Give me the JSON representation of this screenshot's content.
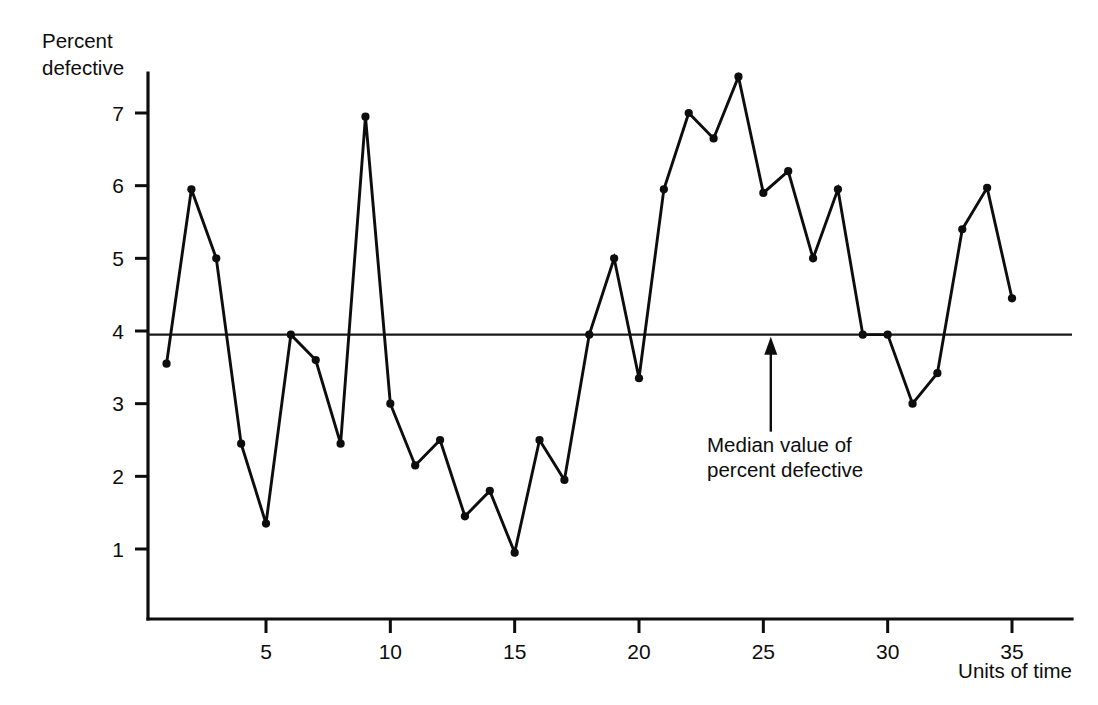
{
  "chart_data": {
    "type": "line",
    "title": "",
    "ylabel_line1": "Percent",
    "ylabel_line2": "defective",
    "xlabel": "Units of time",
    "x": [
      1,
      2,
      3,
      4,
      5,
      6,
      7,
      8,
      9,
      10,
      11,
      12,
      13,
      14,
      15,
      16,
      17,
      18,
      19,
      20,
      21,
      22,
      23,
      24,
      25,
      26,
      27,
      28,
      29,
      30,
      31,
      32,
      33,
      34,
      35
    ],
    "values": [
      3.55,
      5.95,
      5.0,
      2.45,
      1.35,
      3.95,
      3.6,
      2.45,
      6.95,
      3.0,
      2.15,
      2.5,
      1.45,
      1.8,
      0.95,
      2.5,
      1.95,
      3.95,
      5.0,
      3.35,
      5.95,
      7.0,
      6.65,
      7.5,
      5.9,
      6.2,
      5.0,
      5.95,
      3.95,
      3.95,
      3.0,
      3.42,
      5.4,
      5.97,
      4.45
    ],
    "xlim": [
      0.2,
      36.2
    ],
    "ylim": [
      0,
      7.85
    ],
    "xticks": [
      5,
      10,
      15,
      20,
      25,
      30,
      35
    ],
    "xtick_labels": [
      "5",
      "10",
      "15",
      "20",
      "25",
      "30",
      "35"
    ],
    "yticks": [
      1,
      2,
      3,
      4,
      5,
      6,
      7
    ],
    "ytick_labels": [
      "1",
      "2",
      "3",
      "4",
      "5",
      "6",
      "7"
    ],
    "grid": false,
    "legend": "none",
    "median_value": 3.95,
    "annotation": {
      "line1": "Median value of",
      "line2": "percent defective",
      "arrow_at_x": 25.3,
      "marker": "up-arrow"
    },
    "colors": {
      "line": "#0d0d0d",
      "marker": "#0d0d0d",
      "axis": "#0d0d0d",
      "median": "#1a1a1a",
      "background": "#ffffff"
    }
  }
}
